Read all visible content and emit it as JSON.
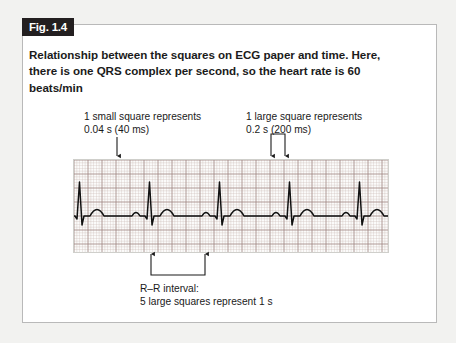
{
  "figure": {
    "badge_label": "Fig. 1.4",
    "caption": "Relationship between the squares on ECG paper and time. Here, there is one QRS complex per second, so the heart rate is 60 beats/min"
  },
  "annotations": {
    "small_square": {
      "line1": "1 small square represents",
      "line2": "0.04 s (40 ms)",
      "marker": "down-arrow"
    },
    "large_square": {
      "line1": "1 large square represents",
      "line2": "0.2 s (200 ms)",
      "marker": "double-down-arrow-bracket"
    },
    "rr_interval": {
      "line1": "R–R interval:",
      "line2": "5 large squares represent 1 s",
      "marker": "up-arrow-bracket"
    }
  },
  "ecg": {
    "paper_label": "ecg-graph-paper",
    "small_square_px": 2.8,
    "large_square_px": 14,
    "small_square_seconds": 0.04,
    "large_square_seconds": 0.2,
    "rr_interval_seconds": 1,
    "heart_rate_bpm": 60,
    "beat_count": 7,
    "grid_minor_color": "#cbb9b6",
    "grid_major_color": "#9e8682",
    "trace_color": "#111111",
    "paper_color": "#fbfbfa"
  },
  "colors": {
    "page_background": "#f2f2f0",
    "figure_background": "#ffffff",
    "figure_border": "#b9b9b9",
    "badge_background": "#231f20",
    "badge_text": "#ffffff",
    "caption_text": "#1b1b1b",
    "annotation_text": "#1a1a1a",
    "arrow_color": "#1a1a1a"
  }
}
